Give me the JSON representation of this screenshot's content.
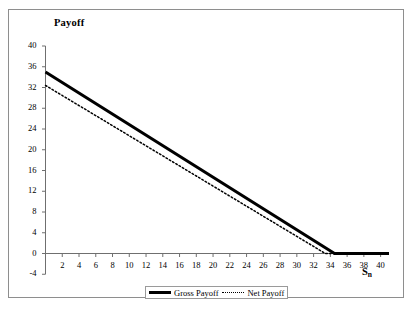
{
  "figure": {
    "y_axis_title": "Payoff",
    "x_axis_title_main": "S",
    "x_axis_title_sub": "n"
  },
  "legend": {
    "items": [
      {
        "label": "Gross Payoff",
        "style": "solid",
        "color": "#000000"
      },
      {
        "label": "Net Payoff",
        "style": "dotted",
        "color": "#000000"
      }
    ]
  },
  "chart_data": {
    "type": "line",
    "title": "",
    "subtitle": "",
    "xlabel": "Sₙ",
    "ylabel": "Payoff",
    "xlim": [
      0,
      41
    ],
    "ylim": [
      -4,
      40
    ],
    "xticks": [
      2,
      4,
      6,
      8,
      10,
      12,
      14,
      16,
      18,
      20,
      22,
      24,
      26,
      28,
      30,
      32,
      34,
      36,
      38,
      40
    ],
    "yticks": [
      -4,
      0,
      4,
      8,
      12,
      16,
      20,
      24,
      28,
      32,
      36,
      40
    ],
    "grid": false,
    "legend_position": "bottom-center",
    "series": [
      {
        "name": "Gross Payoff",
        "style": "solid",
        "linewidth": 3,
        "color": "#000000",
        "x": [
          0,
          34.5,
          41
        ],
        "values": [
          35.0,
          0.0,
          0.0
        ]
      },
      {
        "name": "Net Payoff",
        "style": "dotted",
        "linewidth": 1.5,
        "color": "#000000",
        "x": [
          0,
          33.4,
          41
        ],
        "values": [
          32.4,
          0.0,
          0.0
        ]
      }
    ],
    "annotations": []
  }
}
